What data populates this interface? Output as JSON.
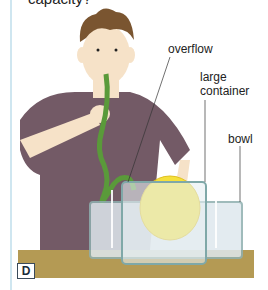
{
  "question_fragment": "capacity?",
  "labels": {
    "overflow": "overflow",
    "large_container_line1": "large",
    "large_container_line2": "container",
    "bowl": "bowl"
  },
  "panel_letter": "D",
  "colors": {
    "table": "#b49a54",
    "shirt": "#735a66",
    "hose": "#5a9a3a",
    "balloon": "#f5e03a",
    "water": "#dfe8ee",
    "container_edge": "#7fa8a8"
  }
}
